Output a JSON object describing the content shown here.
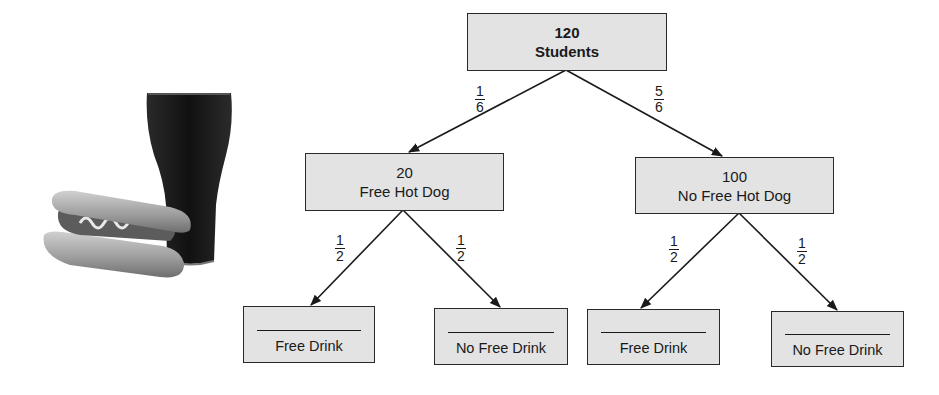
{
  "diagram": {
    "type": "tree-diagram",
    "root": {
      "count": "120",
      "label": "Students"
    },
    "level1": [
      {
        "count": "20",
        "label": "Free Hot Dog",
        "probability": {
          "numerator": "1",
          "denominator": "6"
        }
      },
      {
        "count": "100",
        "label": "No Free Hot Dog",
        "probability": {
          "numerator": "5",
          "denominator": "6"
        }
      }
    ],
    "level2": [
      {
        "count": "",
        "label": "Free Drink",
        "probability": {
          "numerator": "1",
          "denominator": "2"
        }
      },
      {
        "count": "",
        "label": "No Free Drink",
        "probability": {
          "numerator": "1",
          "denominator": "2"
        }
      },
      {
        "count": "",
        "label": "Free Drink",
        "probability": {
          "numerator": "1",
          "denominator": "2"
        }
      },
      {
        "count": "",
        "label": "No Free Drink",
        "probability": {
          "numerator": "1",
          "denominator": "2"
        }
      }
    ],
    "illustration": {
      "items": [
        "hot-dog",
        "soda-glass"
      ]
    },
    "colors": {
      "box_fill": "#e3e3e3",
      "box_border": "#2a2a2a",
      "line": "#1a1a1a",
      "soda": "#151515"
    }
  }
}
